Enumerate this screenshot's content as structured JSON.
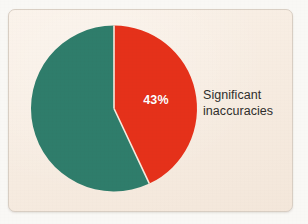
{
  "chart_data": {
    "type": "pie",
    "title": "",
    "subtitle": "",
    "xlabel": "",
    "ylabel": "",
    "grid": false,
    "legend_position": "right",
    "start_angle_deg": 0,
    "direction": "clockwise",
    "categories": [
      "Significant inaccuracies",
      "Other"
    ],
    "values": [
      43,
      57
    ],
    "labels": [
      "43%",
      ""
    ],
    "colors": [
      "#e5311a",
      "#2f7d6b"
    ],
    "annotations": [
      "43%"
    ],
    "slices": [
      {
        "name": "significant-inaccuracies",
        "label": "Significant inaccuracies",
        "value": 43,
        "value_label": "43%",
        "color": "#e5311a",
        "label_shown_on_slice": true
      },
      {
        "name": "remainder",
        "label": "",
        "value": 57,
        "value_label": "",
        "color": "#2f7d6b",
        "label_shown_on_slice": false
      }
    ]
  },
  "geometry": {
    "center_x": 114,
    "center_y": 108.5,
    "radius": 83,
    "separator_color": "#f6eade",
    "separator_width": 1.6
  },
  "card": {
    "background_color": "#f6eade",
    "border_color": "#d9cfc4",
    "page_background_color": "#f9f8f5"
  },
  "slice_label": {
    "text": "43%",
    "color": "#ffffff"
  },
  "legend": {
    "line1": "Significant",
    "line2": "inaccuracies",
    "color": "#2f2e2c"
  }
}
